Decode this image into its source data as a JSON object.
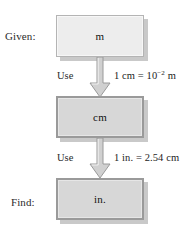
{
  "diagram": {
    "colors": {
      "background": "#ffffff",
      "box_light_fill": "#ededed",
      "box_dark_fill": "#d7d7d7",
      "box_light_border": "#b4b4b4",
      "box_dark_border": "#9a9a9a",
      "shadow": "#c9c9c9",
      "arrow_fill": "#d0d0d0",
      "arrow_border": "#9a9a9a",
      "text": "#1c1c1c"
    },
    "labels": {
      "given": "Given:",
      "find": "Find:"
    },
    "boxes": [
      {
        "id": "box-m",
        "unit": "m",
        "style": "light"
      },
      {
        "id": "box-cm",
        "unit": "cm",
        "style": "dark"
      },
      {
        "id": "box-in",
        "unit": "in.",
        "style": "dark"
      }
    ],
    "conversions": [
      {
        "id": "conv-1",
        "use_label": "Use",
        "equation_left": "1 cm = 10",
        "equation_exponent": "−2",
        "equation_right": " m",
        "equation_plain": "1 cm = 10⁻² m"
      },
      {
        "id": "conv-2",
        "use_label": "Use",
        "equation_left": "1 in. = 2.54 cm",
        "equation_exponent": "",
        "equation_right": "",
        "equation_plain": "1 in. = 2.54 cm"
      }
    ],
    "arrows": [
      {
        "id": "arrow-1",
        "direction": "down"
      },
      {
        "id": "arrow-2",
        "direction": "down"
      }
    ]
  }
}
